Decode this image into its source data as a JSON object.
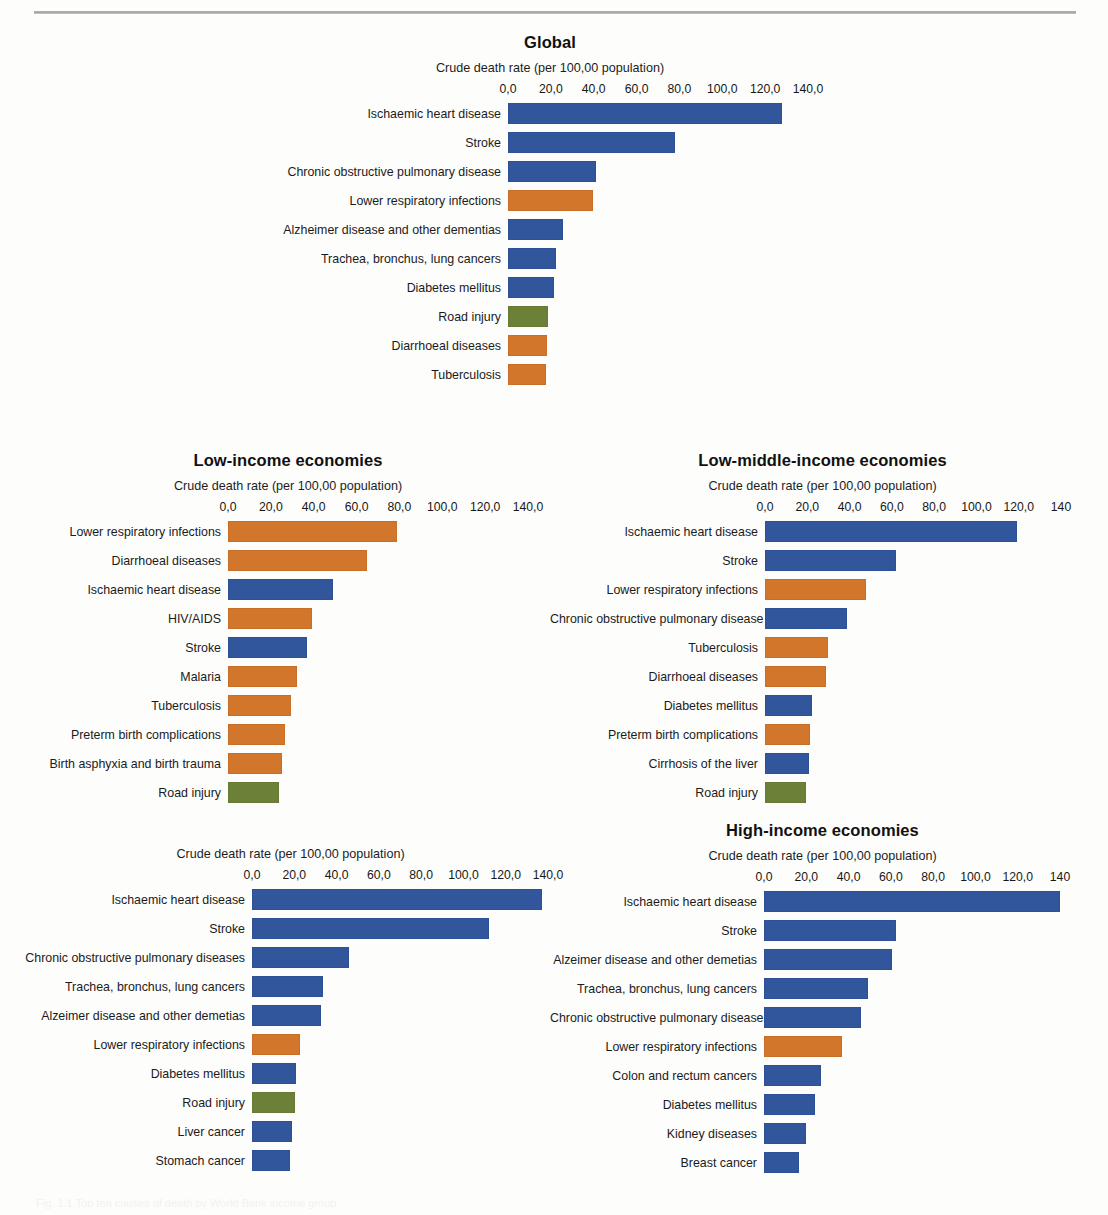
{
  "page": {
    "axis_title": "Crude death rate (per 100,00 population)",
    "caption_cut_off": "Fig. 1.1 Top ten causes of death by World Bank income group"
  },
  "colors": {
    "blue": "#32569b",
    "orange": "#d2762c",
    "green": "#6d8038"
  },
  "chart_data": [
    {
      "id": "global",
      "type": "bar",
      "orientation": "horizontal",
      "title": "Global",
      "xlabel": "Crude death rate (per 100,00 population)",
      "ylabel": "",
      "xlim": [
        0,
        140
      ],
      "grid": false,
      "legend": "none",
      "ticks": [
        "0,0",
        "20,0",
        "40,0",
        "60,0",
        "80,0",
        "100,0",
        "120,0",
        "140,0"
      ],
      "tick_values": [
        0,
        20,
        40,
        60,
        80,
        100,
        120,
        140
      ],
      "categories": [
        "Ischaemic heart disease",
        "Stroke",
        "Chronic obstructive pulmonary disease",
        "Lower respiratory infections",
        "Alzheimer disease and other dementias",
        "Trachea, bronchus, lung cancers",
        "Diabetes mellitus",
        "Road injury",
        "Diarrhoeal diseases",
        "Tuberculosis"
      ],
      "values": [
        128.0,
        78.0,
        41.0,
        39.5,
        25.5,
        22.5,
        21.5,
        18.5,
        18.0,
        17.5
      ],
      "bar_colors": [
        "blue",
        "blue",
        "blue",
        "orange",
        "blue",
        "blue",
        "blue",
        "green",
        "orange",
        "orange"
      ]
    },
    {
      "id": "low-income",
      "type": "bar",
      "orientation": "horizontal",
      "title": "Low-income economies",
      "xlabel": "Crude death rate (per 100,00 population)",
      "ylabel": "",
      "xlim": [
        0,
        140
      ],
      "grid": false,
      "legend": "none",
      "ticks": [
        "0,0",
        "20,0",
        "40,0",
        "60,0",
        "80,0",
        "100,0",
        "120,0",
        "140,0"
      ],
      "tick_values": [
        0,
        20,
        40,
        60,
        80,
        100,
        120,
        140
      ],
      "categories": [
        "Lower respiratory infections",
        "Diarrhoeal diseases",
        "Ischaemic heart disease",
        "HIV/AIDS",
        "Stroke",
        "Malaria",
        "Tuberculosis",
        "Preterm birth complications",
        "Birth asphyxia and birth trauma",
        "Road injury"
      ],
      "values": [
        79.0,
        65.0,
        49.0,
        39.0,
        37.0,
        32.0,
        29.5,
        26.5,
        25.0,
        24.0
      ],
      "bar_colors": [
        "orange",
        "orange",
        "blue",
        "orange",
        "blue",
        "orange",
        "orange",
        "orange",
        "orange",
        "green"
      ]
    },
    {
      "id": "low-middle-income",
      "type": "bar",
      "orientation": "horizontal",
      "title": "Low-middle-income economies",
      "xlabel": "Crude death rate (per 100,00 population)",
      "ylabel": "",
      "xlim": [
        0,
        140
      ],
      "grid": false,
      "legend": "none",
      "ticks": [
        "0,0",
        "20,0",
        "40,0",
        "60,0",
        "80,0",
        "100,0",
        "120,0",
        "140"
      ],
      "tick_values": [
        0,
        20,
        40,
        60,
        80,
        100,
        120,
        140
      ],
      "categories": [
        "Ischaemic heart disease",
        "Stroke",
        "Lower respiratory infections",
        "Chronic obstructive pulmonary disease",
        "Tuberculosis",
        "Diarrhoeal diseases",
        "Diabetes mellitus",
        "Preterm birth complications",
        "Cirrhosis of the liver",
        "Road injury"
      ],
      "values": [
        119.0,
        62.0,
        48.0,
        39.0,
        30.0,
        29.0,
        22.0,
        21.5,
        21.0,
        19.5
      ],
      "bar_colors": [
        "blue",
        "blue",
        "orange",
        "blue",
        "orange",
        "orange",
        "blue",
        "orange",
        "blue",
        "green"
      ]
    },
    {
      "id": "upper-middle-income",
      "type": "bar",
      "orientation": "horizontal",
      "title": "",
      "xlabel": "Crude death rate (per 100,00 population)",
      "ylabel": "",
      "xlim": [
        0,
        140
      ],
      "grid": false,
      "legend": "none",
      "ticks": [
        "0,0",
        "20,0",
        "40,0",
        "60,0",
        "80,0",
        "100,0",
        "120,0",
        "140,0"
      ],
      "tick_values": [
        0,
        20,
        40,
        60,
        80,
        100,
        120,
        140
      ],
      "categories": [
        "Ischaemic heart disease",
        "Stroke",
        "Chronic obstructive pulmonary diseases",
        "Trachea, bronchus, lung cancers",
        "Alzeimer disease and other demetias",
        "Lower respiratory infections",
        "Diabetes mellitus",
        "Road injury",
        "Liver cancer",
        "Stomach cancer"
      ],
      "values": [
        137.0,
        112.0,
        46.0,
        33.5,
        32.5,
        22.5,
        21.0,
        20.5,
        19.0,
        18.0
      ],
      "bar_colors": [
        "blue",
        "blue",
        "blue",
        "blue",
        "blue",
        "orange",
        "blue",
        "green",
        "blue",
        "blue"
      ]
    },
    {
      "id": "high-income",
      "type": "bar",
      "orientation": "horizontal",
      "title": "High-income economies",
      "xlabel": "Crude death rate (per 100,00 population)",
      "ylabel": "",
      "xlim": [
        0,
        140
      ],
      "grid": false,
      "legend": "none",
      "ticks": [
        "0,0",
        "20,0",
        "40,0",
        "60,0",
        "80,0",
        "100,0",
        "120,0",
        "140"
      ],
      "tick_values": [
        0,
        20,
        40,
        60,
        80,
        100,
        120,
        140
      ],
      "categories": [
        "Ischaemic heart disease",
        "Stroke",
        "Alzeimer disease and other demetias",
        "Trachea, bronchus, lung cancers",
        "Chronic obstructive pulmonary diseases",
        "Lower respiratory infections",
        "Colon and rectum cancers",
        "Diabetes mellitus",
        "Kidney diseases",
        "Breast cancer"
      ],
      "values": [
        140.0,
        62.5,
        60.5,
        49.0,
        46.0,
        37.0,
        27.0,
        24.0,
        20.0,
        16.5
      ],
      "bar_colors": [
        "blue",
        "blue",
        "blue",
        "blue",
        "blue",
        "orange",
        "blue",
        "blue",
        "blue",
        "blue"
      ]
    }
  ]
}
